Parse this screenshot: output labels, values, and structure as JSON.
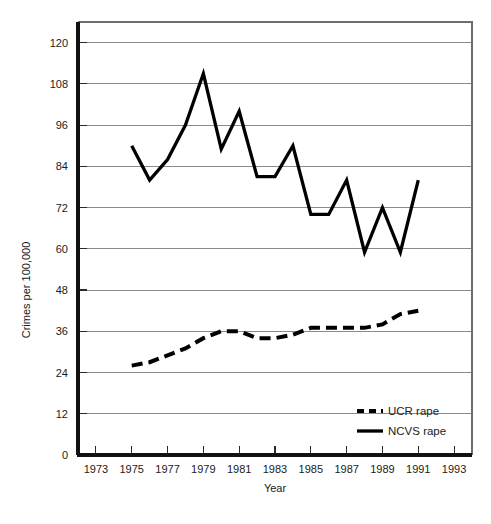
{
  "chart_data": {
    "type": "line",
    "title": "",
    "xlabel": "Year",
    "ylabel": "Crimes per 100,000",
    "xlim": [
      1972,
      1994
    ],
    "ylim": [
      0,
      126
    ],
    "grid": true,
    "legend_position": "inside-bottom-right",
    "x_ticks": [
      1973,
      1975,
      1977,
      1979,
      1981,
      1983,
      1985,
      1987,
      1989,
      1991,
      1993
    ],
    "x_tick_labels": [
      "1973",
      "1975",
      "1977",
      "1979",
      "1981",
      "1983",
      "1985",
      "1987",
      "1989",
      "1991",
      "1993"
    ],
    "y_ticks": [
      0,
      12,
      24,
      36,
      48,
      60,
      72,
      84,
      96,
      108,
      120
    ],
    "y_tick_labels": [
      "0",
      "12",
      "24",
      "36",
      "48",
      "60",
      "72",
      "84",
      "96",
      "108",
      "120"
    ],
    "x": [
      1975,
      1976,
      1977,
      1978,
      1979,
      1980,
      1981,
      1982,
      1983,
      1984,
      1985,
      1986,
      1987,
      1988,
      1989,
      1990,
      1991
    ],
    "series": [
      {
        "name": "UCR rape",
        "style": "dashed",
        "color": "#000000",
        "values": [
          26,
          27,
          29,
          31,
          34,
          36,
          36,
          34,
          34,
          35,
          37,
          37,
          37,
          37,
          38,
          41,
          42
        ]
      },
      {
        "name": "NCVS rape",
        "style": "solid",
        "color": "#000000",
        "values": [
          90,
          80,
          86,
          96,
          111,
          89,
          100,
          81,
          81,
          90,
          70,
          70,
          80,
          59,
          72,
          59,
          80
        ]
      }
    ]
  },
  "legend": {
    "entries": [
      {
        "label": "UCR rape",
        "style": "dashed"
      },
      {
        "label": "NCVS rape",
        "style": "solid"
      }
    ]
  },
  "axes": {
    "y_title": "Crimes per 100,000",
    "x_title": "Year"
  }
}
